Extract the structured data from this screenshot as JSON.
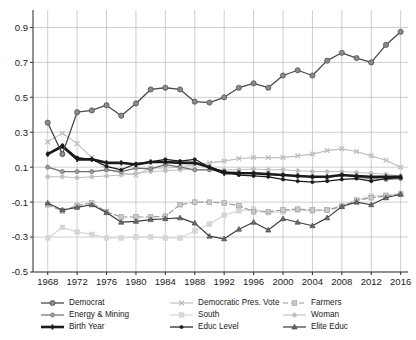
{
  "chart_data": {
    "type": "line",
    "title": "",
    "xlabel": "",
    "ylabel": "",
    "xlim": [
      1966,
      2017
    ],
    "ylim": [
      -0.5,
      1.0
    ],
    "grid": true,
    "legend_position": "bottom",
    "yticks": [
      "0.9",
      "0.7",
      "0.5",
      "0.3",
      "0.1",
      "-0.1",
      "-0.3",
      "-0.5"
    ],
    "ytick_values": [
      0.9,
      0.7,
      0.5,
      0.3,
      0.1,
      -0.1,
      -0.3,
      -0.5
    ],
    "xticks": [
      "1968",
      "1972",
      "1976",
      "1980",
      "1984",
      "1988",
      "1992",
      "1996",
      "2000",
      "2004",
      "2008",
      "2012",
      "2016"
    ],
    "xtick_values": [
      1968,
      1972,
      1976,
      1980,
      1984,
      1988,
      1992,
      1996,
      2000,
      2004,
      2008,
      2012,
      2016
    ],
    "x": [
      1968,
      1970,
      1972,
      1974,
      1976,
      1978,
      1980,
      1982,
      1984,
      1986,
      1988,
      1990,
      1992,
      1994,
      1996,
      1998,
      2000,
      2002,
      2004,
      2006,
      2008,
      2010,
      2012,
      2014,
      2016
    ],
    "series": [
      {
        "name": "Democrat",
        "color": "#8a8a8a",
        "line_color": "#4a4a4a",
        "marker": "circle",
        "dash": "solid",
        "width": 1.3,
        "marker_size": 5.2,
        "values": [
          0.355,
          0.175,
          0.415,
          0.425,
          0.455,
          0.395,
          0.465,
          0.545,
          0.555,
          0.545,
          0.475,
          0.47,
          0.5,
          0.555,
          0.58,
          0.555,
          0.625,
          0.655,
          0.625,
          0.71,
          0.755,
          0.725,
          0.7,
          0.8,
          0.875
        ]
      },
      {
        "name": "Democratic Pres. Vote",
        "color": "#bdbdbd",
        "line_color": "#bdbdbd",
        "marker": "x",
        "dash": "solid",
        "width": 1.1,
        "marker_size": 4.6,
        "values": [
          0.245,
          0.295,
          0.235,
          0.155,
          0.09,
          0.065,
          0.055,
          0.095,
          0.095,
          0.1,
          0.115,
          0.125,
          0.135,
          0.15,
          0.155,
          0.155,
          0.155,
          0.165,
          0.175,
          0.195,
          0.205,
          0.19,
          0.165,
          0.14,
          0.1
        ]
      },
      {
        "name": "Farmers",
        "color": "#c9c9c9",
        "line_color": "#9a9a9a",
        "marker": "square",
        "dash": "dashed",
        "width": 1.2,
        "marker_size": 4.6,
        "values": [
          -0.115,
          -0.15,
          -0.12,
          -0.105,
          -0.155,
          -0.185,
          -0.185,
          -0.185,
          -0.18,
          -0.115,
          -0.1,
          -0.1,
          -0.105,
          -0.12,
          -0.155,
          -0.155,
          -0.145,
          -0.14,
          -0.145,
          -0.145,
          -0.125,
          -0.09,
          -0.075,
          -0.065,
          -0.055
        ]
      },
      {
        "name": "Energy & Mining",
        "color": "#9c9c9c",
        "line_color": "#6e6e6e",
        "marker": "circle",
        "dash": "solid",
        "width": 1.2,
        "marker_size": 4.2,
        "values": [
          0.1,
          0.075,
          0.075,
          0.075,
          0.085,
          0.075,
          0.095,
          0.09,
          0.115,
          0.1,
          0.085,
          0.085,
          0.075,
          0.07,
          0.065,
          0.065,
          0.055,
          0.05,
          0.045,
          0.04,
          0.055,
          0.045,
          0.035,
          0.03,
          0.035
        ]
      },
      {
        "name": "South",
        "color": "#d6d6d6",
        "line_color": "#d6d6d6",
        "marker": "square",
        "dash": "solid",
        "width": 1.2,
        "marker_size": 4.8,
        "values": [
          -0.305,
          -0.245,
          -0.27,
          -0.285,
          -0.305,
          -0.305,
          -0.3,
          -0.3,
          -0.305,
          -0.305,
          -0.265,
          -0.225,
          -0.175,
          -0.15,
          -0.14,
          -0.16,
          -0.155,
          -0.145,
          -0.15,
          -0.145,
          -0.115,
          -0.085,
          -0.065,
          -0.06,
          -0.05
        ]
      },
      {
        "name": "Woman",
        "color": "#bfbfbf",
        "line_color": "#bfbfbf",
        "marker": "circle",
        "dash": "solid",
        "width": 1.1,
        "marker_size": 4.0,
        "values": [
          0.045,
          0.045,
          0.04,
          0.045,
          0.05,
          0.055,
          0.065,
          0.075,
          0.08,
          0.085,
          0.085,
          0.085,
          0.085,
          0.085,
          0.09,
          0.085,
          0.085,
          0.08,
          0.075,
          0.075,
          0.075,
          0.07,
          0.065,
          0.06,
          0.05
        ]
      },
      {
        "name": "Birth Year",
        "color": "#1a1a1a",
        "line_color": "#1a1a1a",
        "marker": "bar",
        "dash": "solid",
        "width": 2.6,
        "marker_size": 3.4,
        "values": [
          0.175,
          0.22,
          0.145,
          0.145,
          0.125,
          0.125,
          0.115,
          0.13,
          0.13,
          0.125,
          0.125,
          0.1,
          0.065,
          0.065,
          0.065,
          0.06,
          0.055,
          0.05,
          0.045,
          0.045,
          0.055,
          0.05,
          0.045,
          0.045,
          0.045
        ]
      },
      {
        "name": "Educ Level",
        "color": "#1a1a1a",
        "line_color": "#1a1a1a",
        "marker": "circle",
        "dash": "solid",
        "width": 1.2,
        "marker_size": 3.2,
        "values": [
          0.175,
          0.225,
          0.155,
          0.145,
          0.105,
          0.085,
          0.12,
          0.13,
          0.145,
          0.135,
          0.145,
          0.1,
          0.075,
          0.055,
          0.05,
          0.045,
          0.03,
          0.02,
          0.015,
          0.02,
          0.03,
          0.035,
          0.02,
          0.035,
          0.04
        ]
      },
      {
        "name": "Elite Educ",
        "color": "#6b6b6b",
        "line_color": "#3d3d3d",
        "marker": "triangle",
        "dash": "solid",
        "width": 1.2,
        "marker_size": 5.0,
        "values": [
          -0.105,
          -0.145,
          -0.13,
          -0.115,
          -0.16,
          -0.215,
          -0.21,
          -0.2,
          -0.195,
          -0.19,
          -0.22,
          -0.295,
          -0.31,
          -0.255,
          -0.215,
          -0.26,
          -0.195,
          -0.215,
          -0.235,
          -0.19,
          -0.125,
          -0.1,
          -0.115,
          -0.075,
          -0.055
        ]
      }
    ]
  },
  "legend": {
    "columns": [
      [
        {
          "label": "Democrat",
          "series": "Democrat"
        },
        {
          "label": "Energy & Mining",
          "series": "Energy & Mining"
        },
        {
          "label": "Birth Year",
          "series": "Birth Year"
        }
      ],
      [
        {
          "label": "Democratic Pres. Vote",
          "series": "Democratic Pres. Vote"
        },
        {
          "label": "South",
          "series": "South"
        },
        {
          "label": "Educ Level",
          "series": "Educ Level"
        }
      ],
      [
        {
          "label": "Farmers",
          "series": "Farmers"
        },
        {
          "label": "Woman",
          "series": "Woman"
        },
        {
          "label": "Elite Educ",
          "series": "Elite Educ"
        }
      ]
    ]
  }
}
